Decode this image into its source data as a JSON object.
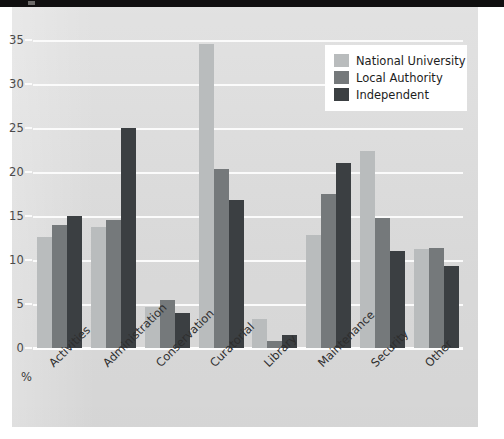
{
  "chart_data": {
    "type": "bar",
    "title": "",
    "subtitle": "",
    "xlabel": "",
    "ylabel": "%",
    "ylim": [
      0,
      35
    ],
    "yticks": [
      0,
      5,
      10,
      15,
      20,
      25,
      30,
      35
    ],
    "grid": true,
    "legend_position": "top-right",
    "categories": [
      "Activities",
      "Administration",
      "Conservation",
      "Curatorial",
      "Library",
      "Maintenance",
      "Security",
      "Other"
    ],
    "series": [
      {
        "name": "National University",
        "color": "#b9bcbd",
        "values": [
          12.6,
          13.8,
          4.7,
          34.5,
          3.3,
          12.8,
          22.4,
          11.3
        ]
      },
      {
        "name": "Local Authority",
        "color": "#75797b",
        "values": [
          14.0,
          14.5,
          5.4,
          20.3,
          0.8,
          17.5,
          14.8,
          11.4
        ]
      },
      {
        "name": "Independent",
        "color": "#3b3f42",
        "values": [
          15.0,
          25.0,
          4.0,
          16.8,
          1.5,
          21.0,
          11.0,
          9.3
        ]
      }
    ]
  },
  "axis": {
    "unit_label": "%"
  },
  "legend": {
    "items": [
      {
        "label": "National University",
        "swatch": "#b9bcbd"
      },
      {
        "label": "Local Authority",
        "swatch": "#75797b"
      },
      {
        "label": "Independent",
        "swatch": "#3b3f42"
      }
    ]
  },
  "colors": {
    "paper": "#dcdcdc",
    "page": "#ffffff",
    "gridline": "#fbfbfb",
    "tick_text": "#4a4a4a",
    "label_text": "#2e2e2e",
    "scan_strip": "#100f10"
  }
}
